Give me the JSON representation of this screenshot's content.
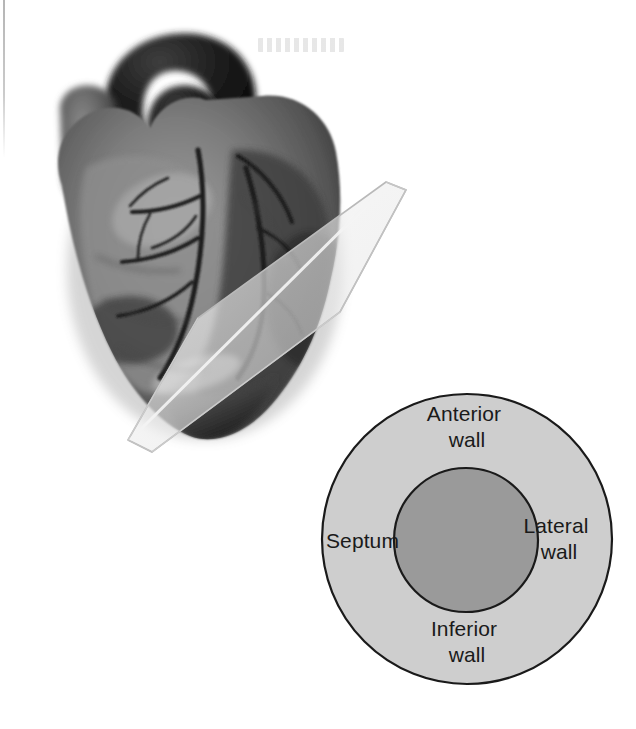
{
  "figure": {
    "background_color": "#ffffff"
  },
  "heart_illustration": {
    "name": "anatomical heart with short-axis cutting plane",
    "description": "Grayscale three-dimensional rendering of a human heart viewed anteriorly, with a translucent planar slice passing diagonally through the ventricles",
    "colors": {
      "great_vessels_dark": "#141414",
      "myocardium_mid": "#6e6e6e",
      "myocardium_light": "#a9a9a9",
      "myocardium_shadow": "#3a3a3a",
      "coronary_vessel": "#232323",
      "highlight": "#d2d2d2"
    },
    "cutting_plane": {
      "name": "short-axis cutting plane",
      "fill_color": "#f0f0f0",
      "edge_color": "#b4b4b4",
      "opacity": 0.55
    }
  },
  "cross_section": {
    "name": "left ventricular short-axis cross-section",
    "outer_circle": {
      "label": "myocardial wall ring",
      "fill_color": "#cecece",
      "stroke_color": "#1a1a1a"
    },
    "inner_circle": {
      "label": "ventricular cavity",
      "fill_color": "#9a9a9a",
      "stroke_color": "#1a1a1a"
    },
    "labels": [
      {
        "id": "anterior",
        "line1": "Anterior",
        "line2": "wall"
      },
      {
        "id": "septum",
        "line1": "Septum",
        "line2": ""
      },
      {
        "id": "lateral",
        "line1": "Lateral",
        "line2": "wall"
      },
      {
        "id": "inferior",
        "line1": "Inferior",
        "line2": "wall"
      }
    ]
  }
}
